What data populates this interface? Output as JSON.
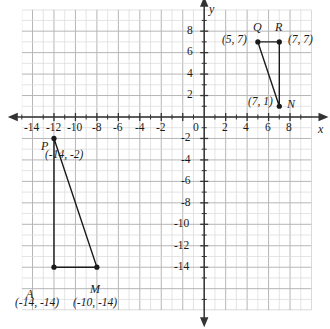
{
  "figure": {
    "type": "coordinate-plane",
    "axis_labels": {
      "x": "x",
      "y": "y",
      "origin": "0"
    },
    "x_ticks": [
      "-14",
      "-12",
      "-10",
      "-8",
      "-6",
      "-4",
      "-2",
      "2",
      "4",
      "6",
      "8"
    ],
    "y_ticks": [
      "8",
      "6",
      "4",
      "2",
      "-2",
      "-4",
      "-6",
      "-8",
      "-10",
      "-12",
      "-14"
    ]
  },
  "chart_data": {
    "type": "scatter",
    "title": "",
    "xlabel": "x",
    "ylabel": "y",
    "xlim": [
      -17,
      10
    ],
    "ylim": [
      -18,
      10
    ],
    "grid": true,
    "x_tick_values": [
      -14,
      -12,
      -10,
      -8,
      -6,
      -4,
      -2,
      2,
      4,
      6,
      8
    ],
    "y_tick_values": [
      8,
      6,
      4,
      2,
      -2,
      -4,
      -6,
      -8,
      -10,
      -12,
      -14
    ],
    "x_tick_labels": [
      "-14",
      "-12",
      "-10",
      "-8",
      "-6",
      "-4",
      "-2",
      "2",
      "4",
      "6",
      "8"
    ],
    "y_tick_labels": [
      "8",
      "6",
      "4",
      "2",
      "-2",
      "-4",
      "-6",
      "-8",
      "-10",
      "-12",
      "-14"
    ],
    "series": [
      {
        "name": "triangle-QRN",
        "closed": true,
        "points": [
          {
            "label": "Q",
            "coord_text": "(5, 7)",
            "x": 5,
            "y": 7
          },
          {
            "label": "R",
            "coord_text": "(7, 7)",
            "x": 7,
            "y": 7
          },
          {
            "label": "N",
            "coord_text": "(7, 1)",
            "x": 7,
            "y": 1
          }
        ]
      },
      {
        "name": "triangle-PRM",
        "closed": true,
        "points": [
          {
            "label": "P",
            "coord_text": "(-14, -2)",
            "x": -14,
            "y": -2
          },
          {
            "label": "M",
            "coord_text": "(-10, -14)",
            "x": -10,
            "y": -14
          },
          {
            "label": "A",
            "coord_text": "(-14, -14)",
            "x": -14,
            "y": -14
          }
        ]
      }
    ]
  },
  "points": {
    "Q": {
      "name": "Q",
      "coords": "(5, 7)"
    },
    "R": {
      "name": "R",
      "coords": "(7, 7)"
    },
    "N": {
      "name": "N",
      "coords": "(7, 1)"
    },
    "P": {
      "name": "P",
      "coords": "(-14, -2)"
    },
    "M": {
      "name": "M",
      "coords": "(-10, -14)"
    },
    "A": {
      "name": "A",
      "coords": "(-14, -14)"
    }
  },
  "colors": {
    "grid_minor": "#d8d8d8",
    "grid_major": "#b6b6b6",
    "axis": "#333333",
    "shape": "#1a1a1a"
  }
}
